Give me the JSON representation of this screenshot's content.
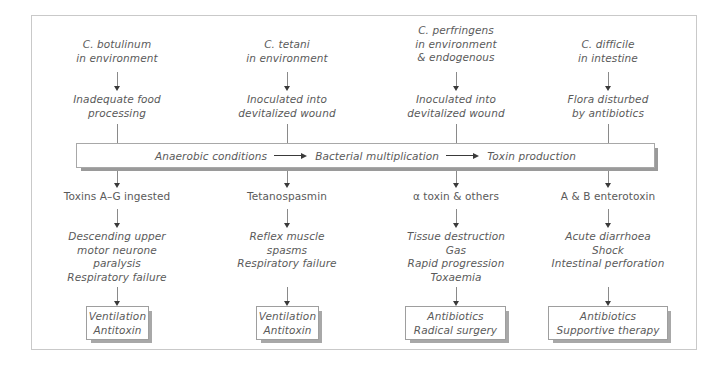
{
  "diagram": {
    "central_bar": {
      "step1": "Anaerobic conditions",
      "step2": "Bacterial multiplication",
      "step3": "Toxin production",
      "arrow_icon": "right-arrow-icon"
    },
    "columns": [
      {
        "id": "c-botulinum",
        "organism": "C. botulinum\nin environment",
        "route": "Inadequate food\nprocessing",
        "toxin": "Toxins A–G ingested",
        "effects": "Descending upper\nmotor neurone\nparalysis\nRespiratory failure",
        "treatment": "Ventilation\nAntitoxin"
      },
      {
        "id": "c-tetani",
        "organism": "C. tetani\nin environment",
        "route": "Inoculated into\ndevitalized wound",
        "toxin": "Tetanospasmin",
        "effects": "Reflex muscle\nspasms\nRespiratory failure",
        "treatment": "Ventilation\nAntitoxin"
      },
      {
        "id": "c-perfringens",
        "organism": "C. perfringens\nin environment\n& endogenous",
        "route": "Inoculated into\ndevitalized wound",
        "toxin": "α toxin & others",
        "effects": "Tissue destruction\nGas\nRapid progression\nToxaemia",
        "treatment": "Antibiotics\nRadical surgery"
      },
      {
        "id": "c-difficile",
        "organism": "C. difficile\nin intestine",
        "route": "Flora disturbed\nby antibiotics",
        "toxin": "A & B enterotoxin",
        "effects": "Acute diarrhoea\nShock\nIntestinal perforation",
        "treatment": "Antibiotics\nSupportive therapy"
      }
    ],
    "colors": {
      "text": "#5a5a5a",
      "frame": "#c9c9c9",
      "arrow": "#3a3a3a",
      "shadow": "#a8a8a8",
      "background": "#ffffff"
    }
  }
}
